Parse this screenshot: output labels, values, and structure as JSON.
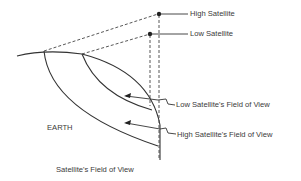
{
  "diagram": {
    "title": "Satellite's Field of View",
    "earth_label": "EARTH",
    "labels": {
      "high_satellite": "High Satellite",
      "low_satellite": "Low Satellite",
      "low_fov": "Low Satellite's Field of View",
      "high_fov": "High Satellite's Field of View"
    },
    "colors": {
      "line": "#333333",
      "text": "#3a3a3a",
      "background": "#ffffff"
    }
  }
}
